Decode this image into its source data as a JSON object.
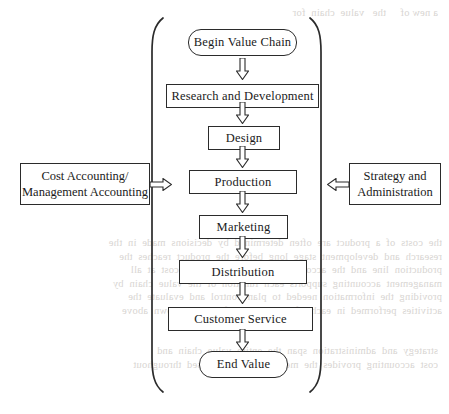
{
  "diagram": {
    "colors": {
      "stroke": "#2b2b2b",
      "text": "#1a1a1a",
      "background": "#ffffff",
      "bleed_text": "#d8d5d2"
    },
    "chain": [
      {
        "id": "begin-value-chain",
        "label": "Begin Value Chain",
        "shape": "rounded",
        "x": 188,
        "y": 29,
        "w": 109,
        "h": 27
      },
      {
        "id": "research-and-development",
        "label": "Research and Development",
        "shape": "rectangle",
        "x": 166,
        "y": 84,
        "w": 153,
        "h": 24
      },
      {
        "id": "design",
        "label": "Design",
        "shape": "rectangle",
        "x": 208,
        "y": 126,
        "w": 72,
        "h": 24
      },
      {
        "id": "production",
        "label": "Production",
        "shape": "rectangle",
        "x": 189,
        "y": 170,
        "w": 108,
        "h": 24
      },
      {
        "id": "marketing",
        "label": "Marketing",
        "shape": "rectangle",
        "x": 199,
        "y": 215,
        "w": 89,
        "h": 24
      },
      {
        "id": "distribution",
        "label": "Distribution",
        "shape": "rectangle",
        "x": 179,
        "y": 260,
        "w": 128,
        "h": 24
      },
      {
        "id": "customer-service",
        "label": "Customer Service",
        "shape": "rectangle",
        "x": 168,
        "y": 307,
        "w": 145,
        "h": 24
      },
      {
        "id": "end-value",
        "label": "End Value",
        "shape": "rounded",
        "x": 199,
        "y": 351,
        "w": 89,
        "h": 27
      }
    ],
    "arrows": [
      {
        "id": "arrow-begin-to-research",
        "from": "begin-value-chain",
        "to": "research-and-development",
        "x": 236,
        "y": 58
      },
      {
        "id": "arrow-research-to-design",
        "from": "research-and-development",
        "to": "design",
        "x": 236,
        "y": 102
      },
      {
        "id": "arrow-design-to-production",
        "from": "design",
        "to": "production",
        "x": 236,
        "y": 146
      },
      {
        "id": "arrow-production-to-marketing",
        "from": "production",
        "to": "marketing",
        "x": 236,
        "y": 191
      },
      {
        "id": "arrow-marketing-to-distribution",
        "from": "marketing",
        "to": "distribution",
        "x": 236,
        "y": 236
      },
      {
        "id": "arrow-distribution-to-customer",
        "from": "distribution",
        "to": "customer-service",
        "x": 236,
        "y": 282
      },
      {
        "id": "arrow-customer-to-end",
        "from": "customer-service",
        "to": "end-value",
        "x": 236,
        "y": 329
      }
    ],
    "side_boxes": [
      {
        "id": "cost-accounting",
        "line1": "Cost Accounting/",
        "line2": "Management Accounting",
        "x": 20,
        "y": 163,
        "w": 130,
        "h": 42,
        "arrow_direction": "right",
        "arrow_x": 150,
        "arrow_y": 178
      },
      {
        "id": "strategy-administration",
        "line1": "Strategy and",
        "line2": "Administration",
        "x": 349,
        "y": 163,
        "w": 92,
        "h": 42,
        "arrow_direction": "left",
        "arrow_x": 327,
        "arrow_y": 178
      }
    ],
    "brackets": {
      "left": {
        "x_top": 163,
        "x_mid": 152,
        "y_top": 18,
        "y_bottom": 392
      },
      "right": {
        "x_top": 310,
        "x_mid": 321,
        "y_top": 18,
        "y_bottom": 392
      }
    }
  }
}
